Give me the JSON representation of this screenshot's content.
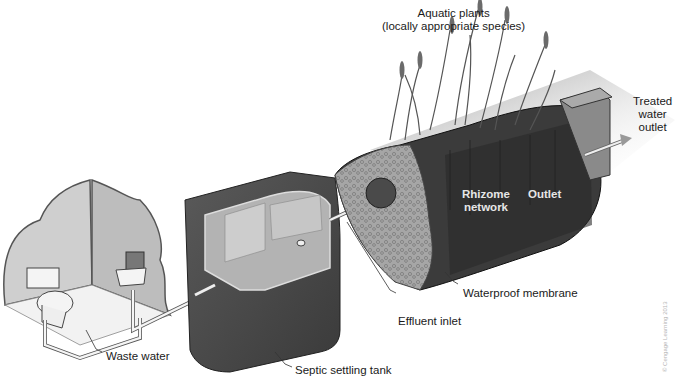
{
  "diagram": {
    "components": [
      {
        "id": "bathroom",
        "name": "Bathroom (toilet and sink)"
      },
      {
        "id": "septic_tank",
        "name": "Septic settling tank"
      },
      {
        "id": "wetland",
        "name": "Planted wetland cell"
      },
      {
        "id": "outlet_box",
        "name": "Outlet box"
      }
    ],
    "flow": [
      "Waste water",
      "Septic settling tank",
      "Effluent inlet",
      "Rhizome network",
      "Outlet",
      "Treated water outlet"
    ]
  },
  "labels": {
    "aquatic_plants_line1": "Aquatic plants",
    "aquatic_plants_line2": "(locally appropriate species)",
    "treated_line1": "Treated",
    "treated_line2": "water",
    "treated_line3": "outlet",
    "rhizome_line1": "Rhizome",
    "rhizome_line2": "network",
    "outlet": "Outlet",
    "waterproof_membrane": "Waterproof membrane",
    "effluent_inlet": "Effluent inlet",
    "septic_tank": "Septic settling tank",
    "waste_water": "Waste water",
    "copyright": "© Cengage Learning 2013"
  },
  "colors": {
    "wall": "#c9c9c9",
    "tank_dark": "#4a4a4a",
    "tank_inner": "#a9a9a9",
    "wetland_dark": "#3a3a3a",
    "gravel": "#9d9d9d",
    "pipe": "#e8e8e8",
    "text": "#1a1a1a"
  }
}
